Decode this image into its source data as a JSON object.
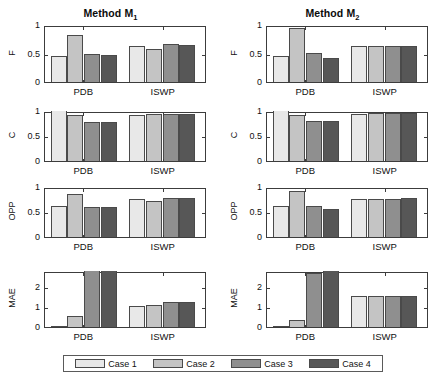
{
  "figure": {
    "width": 443,
    "height": 387,
    "background": "#ffffff",
    "caption": ""
  },
  "legend": {
    "position": "bottom-center",
    "entries": [
      {
        "label": "Case 1",
        "color": "#e8e8e8"
      },
      {
        "label": "Case 2",
        "color": "#c4c4c4"
      },
      {
        "label": "Case 3",
        "color": "#8f8f8f"
      },
      {
        "label": "Case 4",
        "color": "#575757"
      }
    ]
  },
  "panels": [
    {
      "title": "Method M",
      "subscript": "1"
    },
    {
      "title": "Method M",
      "subscript": "2"
    }
  ],
  "chart_data": [
    {
      "type": "bar",
      "title": "Method M₁",
      "panel": "left",
      "metric": "F",
      "ylabel": "F",
      "xlabel": "",
      "categories": [
        "PDB",
        "ISWP"
      ],
      "ylim": [
        0,
        1
      ],
      "yticks": [
        0,
        0.5,
        1
      ],
      "ytick_labels": [
        "0",
        "0.5",
        "1"
      ],
      "grid": false,
      "series": [
        {
          "name": "Case 1",
          "values": [
            0.45,
            0.64
          ]
        },
        {
          "name": "Case 2",
          "values": [
            0.82,
            0.58
          ]
        },
        {
          "name": "Case 3",
          "values": [
            0.49,
            0.66
          ]
        },
        {
          "name": "Case 4",
          "values": [
            0.48,
            0.65
          ]
        }
      ]
    },
    {
      "type": "bar",
      "title": "Method M₁",
      "panel": "left",
      "metric": "C",
      "ylabel": "C",
      "xlabel": "",
      "categories": [
        "PDB",
        "ISWP"
      ],
      "ylim": [
        0,
        1
      ],
      "yticks": [
        0,
        0.5,
        1
      ],
      "ytick_labels": [
        "0",
        "0.5",
        "1"
      ],
      "grid": false,
      "series": [
        {
          "name": "Case 1",
          "values": [
            1.0,
            0.93
          ]
        },
        {
          "name": "Case 2",
          "values": [
            0.92,
            0.94
          ]
        },
        {
          "name": "Case 3",
          "values": [
            0.79,
            0.95
          ]
        },
        {
          "name": "Case 4",
          "values": [
            0.785,
            0.95
          ]
        }
      ]
    },
    {
      "type": "bar",
      "title": "Method M₁",
      "panel": "left",
      "metric": "OPP",
      "ylabel": "OPP",
      "xlabel": "",
      "categories": [
        "PDB",
        "ISWP"
      ],
      "ylim": [
        0,
        1
      ],
      "yticks": [
        0,
        0.5,
        1
      ],
      "ytick_labels": [
        "0",
        "0.5",
        "1"
      ],
      "grid": false,
      "series": [
        {
          "name": "Case 1",
          "values": [
            0.62,
            0.76
          ]
        },
        {
          "name": "Case 2",
          "values": [
            0.87,
            0.72
          ]
        },
        {
          "name": "Case 3",
          "values": [
            0.61,
            0.79
          ]
        },
        {
          "name": "Case 4",
          "values": [
            0.595,
            0.78
          ]
        }
      ]
    },
    {
      "type": "bar",
      "title": "Method M₁",
      "panel": "left",
      "metric": "MAE",
      "ylabel": "MAE",
      "xlabel": "",
      "categories": [
        "PDB",
        "ISWP"
      ],
      "ylim": [
        0,
        2.8
      ],
      "yticks": [
        0,
        1,
        2
      ],
      "ytick_labels": [
        "0",
        "1",
        "2"
      ],
      "grid": false,
      "series": [
        {
          "name": "Case 1",
          "values": [
            0.06,
            1.05
          ]
        },
        {
          "name": "Case 2",
          "values": [
            0.57,
            1.1
          ]
        },
        {
          "name": "Case 3",
          "values": [
            2.8,
            1.25
          ]
        },
        {
          "name": "Case 4",
          "values": [
            2.8,
            1.25
          ]
        }
      ]
    },
    {
      "type": "bar",
      "title": "Method M₂",
      "panel": "right",
      "metric": "F",
      "ylabel": "F",
      "xlabel": "",
      "categories": [
        "PDB",
        "ISWP"
      ],
      "ylim": [
        0,
        1
      ],
      "yticks": [
        0,
        0.5,
        1
      ],
      "ytick_labels": [
        "0",
        "0.5",
        "1"
      ],
      "grid": false,
      "series": [
        {
          "name": "Case 1",
          "values": [
            0.45,
            0.63
          ]
        },
        {
          "name": "Case 2",
          "values": [
            0.94,
            0.63
          ]
        },
        {
          "name": "Case 3",
          "values": [
            0.51,
            0.63
          ]
        },
        {
          "name": "Case 4",
          "values": [
            0.43,
            0.64
          ]
        }
      ]
    },
    {
      "type": "bar",
      "title": "Method M₂",
      "panel": "right",
      "metric": "C",
      "ylabel": "C",
      "xlabel": "",
      "categories": [
        "PDB",
        "ISWP"
      ],
      "ylim": [
        0,
        1
      ],
      "yticks": [
        0,
        0.5,
        1
      ],
      "ytick_labels": [
        "0",
        "0.5",
        "1"
      ],
      "grid": false,
      "series": [
        {
          "name": "Case 1",
          "values": [
            1.0,
            0.94
          ]
        },
        {
          "name": "Case 2",
          "values": [
            0.93,
            0.96
          ]
        },
        {
          "name": "Case 3",
          "values": [
            0.81,
            0.96
          ]
        },
        {
          "name": "Case 4",
          "values": [
            0.8,
            0.96
          ]
        }
      ]
    },
    {
      "type": "bar",
      "title": "Method M₂",
      "panel": "right",
      "metric": "OPP",
      "ylabel": "OPP",
      "xlabel": "",
      "categories": [
        "PDB",
        "ISWP"
      ],
      "ylim": [
        0,
        1
      ],
      "yticks": [
        0,
        0.5,
        1
      ],
      "ytick_labels": [
        "0",
        "0.5",
        "1"
      ],
      "grid": false,
      "series": [
        {
          "name": "Case 1",
          "values": [
            0.62,
            0.77
          ]
        },
        {
          "name": "Case 2",
          "values": [
            0.93,
            0.77
          ]
        },
        {
          "name": "Case 3",
          "values": [
            0.63,
            0.77
          ]
        },
        {
          "name": "Case 4",
          "values": [
            0.56,
            0.78
          ]
        }
      ]
    },
    {
      "type": "bar",
      "title": "Method M₂",
      "panel": "right",
      "metric": "MAE",
      "ylabel": "MAE",
      "xlabel": "",
      "categories": [
        "PDB",
        "ISWP"
      ],
      "ylim": [
        0,
        2.8
      ],
      "yticks": [
        0,
        1,
        2
      ],
      "ytick_labels": [
        "0",
        "1",
        "2"
      ],
      "grid": false,
      "series": [
        {
          "name": "Case 1",
          "values": [
            0.07,
            1.55
          ]
        },
        {
          "name": "Case 2",
          "values": [
            0.33,
            1.55
          ]
        },
        {
          "name": "Case 3",
          "values": [
            2.72,
            1.55
          ]
        },
        {
          "name": "Case 4",
          "values": [
            2.8,
            1.55
          ]
        }
      ]
    }
  ]
}
